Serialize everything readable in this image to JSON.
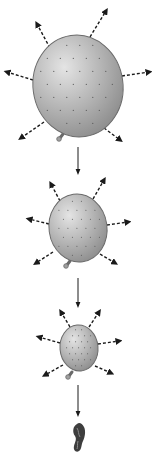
{
  "diagram": {
    "colors": {
      "background": "#ffffff",
      "balloon_fill_light": "#e2e2e2",
      "balloon_fill_dark": "#8e8e8e",
      "balloon_outline": "#6a6a6a",
      "dot": "#555555",
      "arrow": "#1a1a1a",
      "crumpled": "#3a3a3a"
    },
    "stages": [
      {
        "name": "large-balloon",
        "escape_arrows": 6
      },
      {
        "name": "medium-balloon",
        "escape_arrows": 6
      },
      {
        "name": "small-balloon",
        "escape_arrows": 6
      },
      {
        "name": "deflated-balloon",
        "escape_arrows": 0
      }
    ],
    "transition_arrows": 3,
    "icons": {
      "escape_arrow": "dashed-arrow-outward",
      "transition_arrow": "arrow-down"
    }
  }
}
